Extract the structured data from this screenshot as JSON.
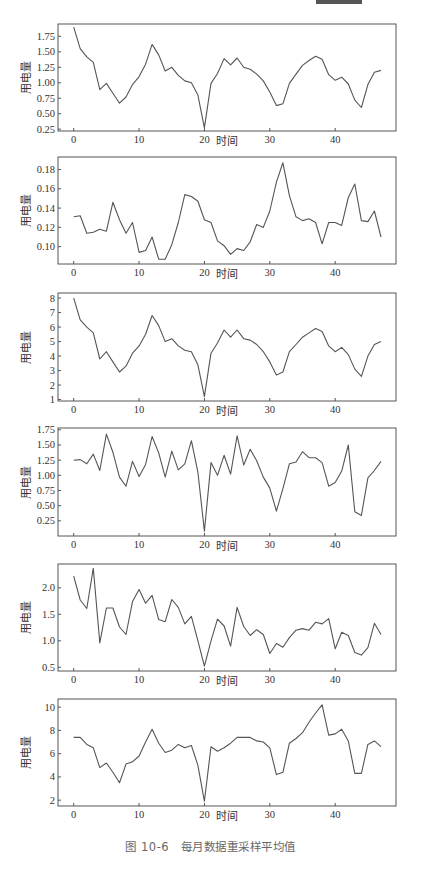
{
  "caption": "图 10-6　每月数据重采样平均值",
  "chart_data": [
    {
      "type": "line",
      "title": "",
      "xlabel": "时间",
      "ylabel": "用电量",
      "x": [
        0,
        1,
        2,
        3,
        4,
        5,
        6,
        7,
        8,
        9,
        10,
        11,
        12,
        13,
        14,
        15,
        16,
        17,
        18,
        19,
        20,
        21,
        22,
        23,
        24,
        25,
        26,
        27,
        28,
        29,
        30,
        31,
        32,
        33,
        34,
        35,
        36,
        37,
        38,
        39,
        40,
        41,
        42,
        43,
        44,
        45,
        46,
        47
      ],
      "values": [
        1.9,
        1.55,
        1.42,
        1.33,
        0.89,
        0.99,
        0.83,
        0.67,
        0.77,
        0.97,
        1.1,
        1.3,
        1.62,
        1.45,
        1.19,
        1.25,
        1.12,
        1.03,
        1.0,
        0.8,
        0.27,
        0.99,
        1.15,
        1.39,
        1.29,
        1.4,
        1.25,
        1.22,
        1.14,
        1.03,
        0.85,
        0.63,
        0.66,
        0.99,
        1.14,
        1.28,
        1.36,
        1.43,
        1.38,
        1.13,
        1.04,
        1.09,
        0.98,
        0.72,
        0.6,
        0.97,
        1.17,
        1.2
      ],
      "xticks": [
        0,
        10,
        20,
        30,
        40
      ],
      "yticks": [
        0.25,
        0.5,
        0.75,
        1.0,
        1.25,
        1.5,
        1.75
      ],
      "ytick_labels": [
        "0.25",
        "0.50",
        "0.75",
        "1.00",
        "1.25",
        "1.50",
        "1.75"
      ],
      "ylim": [
        0.22,
        1.95
      ],
      "xlim": [
        -2.4,
        49.3
      ],
      "grid": false,
      "legend": null
    },
    {
      "type": "line",
      "title": "",
      "xlabel": "时间",
      "ylabel": "用电量",
      "x": [
        0,
        1,
        2,
        3,
        4,
        5,
        6,
        7,
        8,
        9,
        10,
        11,
        12,
        13,
        14,
        15,
        16,
        17,
        18,
        19,
        20,
        21,
        22,
        23,
        24,
        25,
        26,
        27,
        28,
        29,
        30,
        31,
        32,
        33,
        34,
        35,
        36,
        37,
        38,
        39,
        40,
        41,
        42,
        43,
        44,
        45,
        46,
        47
      ],
      "values": [
        0.131,
        0.132,
        0.114,
        0.115,
        0.118,
        0.116,
        0.146,
        0.128,
        0.114,
        0.125,
        0.094,
        0.096,
        0.11,
        0.087,
        0.087,
        0.102,
        0.125,
        0.154,
        0.152,
        0.147,
        0.128,
        0.125,
        0.106,
        0.101,
        0.092,
        0.098,
        0.096,
        0.105,
        0.123,
        0.12,
        0.137,
        0.167,
        0.187,
        0.153,
        0.131,
        0.127,
        0.129,
        0.125,
        0.103,
        0.125,
        0.125,
        0.122,
        0.151,
        0.165,
        0.127,
        0.126,
        0.137,
        0.11
      ],
      "xticks": [
        0,
        10,
        20,
        30,
        40
      ],
      "yticks": [
        0.1,
        0.12,
        0.14,
        0.16,
        0.18
      ],
      "ytick_labels": [
        "0.10",
        "0.12",
        "0.14",
        "0.16",
        "0.18"
      ],
      "ylim": [
        0.082,
        0.193
      ],
      "xlim": [
        -2.4,
        49.3
      ],
      "grid": false,
      "legend": null
    },
    {
      "type": "line",
      "title": "",
      "xlabel": "时间",
      "ylabel": "用电量",
      "x": [
        0,
        1,
        2,
        3,
        4,
        5,
        6,
        7,
        8,
        9,
        10,
        11,
        12,
        13,
        14,
        15,
        16,
        17,
        18,
        19,
        20,
        21,
        22,
        23,
        24,
        25,
        26,
        27,
        28,
        29,
        30,
        31,
        32,
        33,
        34,
        35,
        36,
        37,
        38,
        39,
        40,
        41,
        42,
        43,
        44,
        45,
        46,
        47
      ],
      "values": [
        8.0,
        6.5,
        6.0,
        5.6,
        3.8,
        4.3,
        3.6,
        2.9,
        3.3,
        4.2,
        4.7,
        5.5,
        6.8,
        6.1,
        5.0,
        5.2,
        4.7,
        4.4,
        4.3,
        3.4,
        1.2,
        4.2,
        4.9,
        5.8,
        5.3,
        5.8,
        5.2,
        5.1,
        4.8,
        4.3,
        3.6,
        2.7,
        2.9,
        4.3,
        4.8,
        5.3,
        5.6,
        5.9,
        5.7,
        4.7,
        4.3,
        4.6,
        4.1,
        3.1,
        2.6,
        4.0,
        4.8,
        5.0
      ],
      "xticks": [
        0,
        10,
        20,
        30,
        40
      ],
      "yticks": [
        1,
        2,
        3,
        4,
        5,
        6,
        7,
        8
      ],
      "ytick_labels": [
        "1",
        "2",
        "3",
        "4",
        "5",
        "6",
        "7",
        "8"
      ],
      "ylim": [
        0.9,
        8.35
      ],
      "xlim": [
        -2.4,
        49.3
      ],
      "grid": false,
      "legend": null
    },
    {
      "type": "line",
      "title": "",
      "xlabel": "时间",
      "ylabel": "用电量",
      "x": [
        0,
        1,
        2,
        3,
        4,
        5,
        6,
        7,
        8,
        9,
        10,
        11,
        12,
        13,
        14,
        15,
        16,
        17,
        18,
        19,
        20,
        21,
        22,
        23,
        24,
        25,
        26,
        27,
        28,
        29,
        30,
        31,
        32,
        33,
        34,
        35,
        36,
        37,
        38,
        39,
        40,
        41,
        42,
        43,
        44,
        45,
        46,
        47
      ],
      "values": [
        1.25,
        1.26,
        1.19,
        1.35,
        1.08,
        1.68,
        1.38,
        0.97,
        0.82,
        1.23,
        0.98,
        1.18,
        1.64,
        1.37,
        0.97,
        1.4,
        1.09,
        1.19,
        1.57,
        1.05,
        0.08,
        1.21,
        1.0,
        1.33,
        1.02,
        1.65,
        1.17,
        1.43,
        1.24,
        0.97,
        0.79,
        0.41,
        0.78,
        1.19,
        1.22,
        1.39,
        1.29,
        1.29,
        1.21,
        0.82,
        0.88,
        1.07,
        1.5,
        0.4,
        0.34,
        0.96,
        1.08,
        1.23
      ],
      "xticks": [
        0,
        10,
        20,
        30,
        40
      ],
      "yticks": [
        0.25,
        0.5,
        0.75,
        1.0,
        1.25,
        1.5,
        1.75
      ],
      "ytick_labels": [
        "0.25",
        "0.50",
        "0.75",
        "1.00",
        "1.25",
        "1.50",
        "1.75"
      ],
      "ylim": [
        0.0,
        1.78
      ],
      "xlim": [
        -2.4,
        49.3
      ],
      "grid": false,
      "legend": null
    },
    {
      "type": "line",
      "title": "",
      "xlabel": "时间",
      "ylabel": "用电量",
      "x": [
        0,
        1,
        2,
        3,
        4,
        5,
        6,
        7,
        8,
        9,
        10,
        11,
        12,
        13,
        14,
        15,
        16,
        17,
        18,
        19,
        20,
        21,
        22,
        23,
        24,
        25,
        26,
        27,
        28,
        29,
        30,
        31,
        32,
        33,
        34,
        35,
        36,
        37,
        38,
        39,
        40,
        41,
        42,
        43,
        44,
        45,
        46,
        47
      ],
      "values": [
        2.22,
        1.77,
        1.61,
        2.37,
        0.96,
        1.62,
        1.62,
        1.26,
        1.12,
        1.74,
        1.97,
        1.71,
        1.86,
        1.4,
        1.36,
        1.78,
        1.63,
        1.32,
        1.46,
        1.0,
        0.52,
        1.0,
        1.41,
        1.28,
        0.9,
        1.63,
        1.27,
        1.1,
        1.21,
        1.12,
        0.76,
        0.95,
        0.88,
        1.06,
        1.2,
        1.23,
        1.2,
        1.35,
        1.32,
        1.42,
        0.85,
        1.16,
        1.1,
        0.78,
        0.73,
        0.87,
        1.33,
        1.12
      ],
      "xticks": [
        0,
        10,
        20,
        30,
        40
      ],
      "yticks": [
        0.5,
        1.0,
        1.5,
        2.0
      ],
      "ytick_labels": [
        "0.5",
        "1.0",
        "1.5",
        "2.0"
      ],
      "ylim": [
        0.43,
        2.45
      ],
      "xlim": [
        -2.4,
        49.3
      ],
      "grid": false,
      "legend": null
    },
    {
      "type": "line",
      "title": "",
      "xlabel": "时间",
      "ylabel": "用电量",
      "x": [
        0,
        1,
        2,
        3,
        4,
        5,
        6,
        7,
        8,
        9,
        10,
        11,
        12,
        13,
        14,
        15,
        16,
        17,
        18,
        19,
        20,
        21,
        22,
        23,
        24,
        25,
        26,
        27,
        28,
        29,
        30,
        31,
        32,
        33,
        34,
        35,
        36,
        37,
        38,
        39,
        40,
        41,
        42,
        43,
        44,
        45,
        46,
        47
      ],
      "values": [
        7.4,
        7.4,
        6.8,
        6.5,
        4.8,
        5.2,
        4.4,
        3.5,
        5.1,
        5.3,
        5.8,
        7.0,
        8.1,
        6.9,
        6.1,
        6.3,
        6.8,
        6.5,
        6.7,
        5.0,
        1.9,
        6.6,
        6.2,
        6.5,
        6.9,
        7.4,
        7.4,
        7.4,
        7.1,
        7.0,
        6.5,
        4.2,
        4.4,
        6.9,
        7.3,
        7.8,
        8.7,
        9.5,
        10.2,
        7.6,
        7.7,
        8.1,
        7.1,
        4.3,
        4.3,
        6.8,
        7.1,
        6.6
      ],
      "xticks": [
        0,
        10,
        20,
        30,
        40
      ],
      "yticks": [
        2,
        4,
        6,
        8,
        10
      ],
      "ytick_labels": [
        "2",
        "4",
        "6",
        "8",
        "10"
      ],
      "ylim": [
        1.5,
        10.7
      ],
      "xlim": [
        -2.4,
        49.3
      ],
      "grid": false,
      "legend": null
    }
  ]
}
